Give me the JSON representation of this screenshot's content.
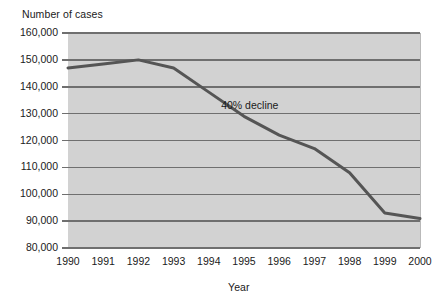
{
  "chart_data": {
    "type": "line",
    "title": "",
    "ylabel": "Number of cases",
    "xlabel": "Year",
    "x": [
      1990,
      1991,
      1992,
      1993,
      1994,
      1995,
      1996,
      1997,
      1998,
      1999,
      2000
    ],
    "categories": [
      "1990",
      "1991",
      "1992",
      "1993",
      "1994",
      "1995",
      "1996",
      "1997",
      "1998",
      "1999",
      "2000"
    ],
    "values": [
      147000,
      148500,
      150000,
      147000,
      138000,
      129000,
      122000,
      117000,
      108000,
      93000,
      91000
    ],
    "series": [
      {
        "name": "Number of cases",
        "values": [
          147000,
          148500,
          150000,
          147000,
          138000,
          129000,
          122000,
          117000,
          108000,
          93000,
          91000
        ]
      }
    ],
    "ylim": [
      80000,
      160000
    ],
    "yticks": [
      80000,
      90000,
      100000,
      110000,
      120000,
      130000,
      140000,
      150000,
      160000
    ],
    "ytick_labels": [
      "80,000",
      "90,000",
      "100,000",
      "110,000",
      "120,000",
      "130,000",
      "140,000",
      "150,000",
      "160,000"
    ],
    "xlim": [
      1990,
      2000
    ],
    "grid": "horizontal",
    "legend": "none",
    "annotations": [
      {
        "text": "40% decline",
        "x": 1996,
        "y": 133000
      }
    ],
    "colors": {
      "plot_background": "#d2d2d2",
      "gridline": "#6f6f6f",
      "line": "#555555",
      "text": "#1a1a1a",
      "page_background": "#ffffff"
    }
  },
  "labels": {
    "y_axis_title": "Number of cases",
    "x_axis_title": "Year",
    "annotation": "40% decline"
  }
}
